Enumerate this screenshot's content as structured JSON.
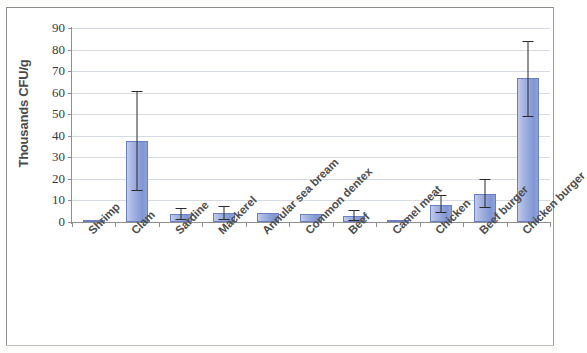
{
  "chart_data": {
    "type": "bar",
    "title": "",
    "subtitle": "",
    "xlabel": "",
    "ylabel": "Thousands CFU/g",
    "ylim": [
      0,
      90
    ],
    "ytick_step": 10,
    "yticks": [
      90,
      80,
      70,
      60,
      50,
      40,
      30,
      20,
      10,
      0
    ],
    "grid": true,
    "legend": "none",
    "error_bars": true,
    "bar_color": "#93a6db",
    "bar_border_color": "#6b7fbe",
    "grid_color": "#cfd3dd",
    "axis_color": "#8f8f8f",
    "categories": [
      "Shrimp",
      "Clam",
      "Sardine",
      "Mackerel",
      "Annular sea bream",
      "Common dentex",
      "Beef",
      "Camel meat",
      "Chicken",
      "Beef burger",
      "Chicken burger"
    ],
    "values": [
      0.7,
      37.5,
      3.5,
      4.0,
      4.2,
      3.8,
      3.0,
      0.4,
      8.0,
      13.0,
      67.0
    ],
    "error_low": [
      0.7,
      15.0,
      1.5,
      1.5,
      4.2,
      3.8,
      1.0,
      0.4,
      4.5,
      7.0,
      49.0
    ],
    "error_high": [
      0.7,
      61.0,
      6.5,
      7.5,
      4.2,
      3.8,
      5.5,
      0.4,
      12.5,
      20.0,
      84.0
    ],
    "series": [
      {
        "name": "Total viable count",
        "values": [
          0.7,
          37.5,
          3.5,
          4.0,
          4.2,
          3.8,
          3.0,
          0.4,
          8.0,
          13.0,
          67.0
        ]
      }
    ]
  }
}
